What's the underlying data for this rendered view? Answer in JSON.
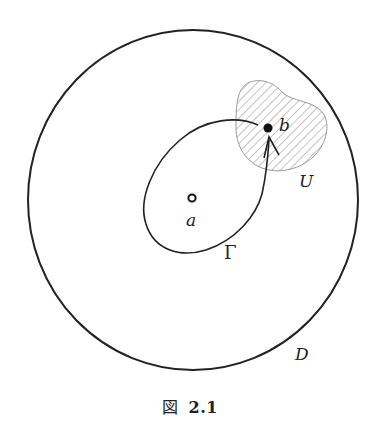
{
  "figure": {
    "labels": {
      "domain": "D",
      "neighborhood": "U",
      "curve": "Γ",
      "point_a": "a",
      "point_b": "b"
    },
    "caption": {
      "prefix": "図",
      "number": "2.1"
    },
    "colors": {
      "stroke": "#222222",
      "hatch": "#8a8a8a",
      "background": "#ffffff"
    }
  }
}
